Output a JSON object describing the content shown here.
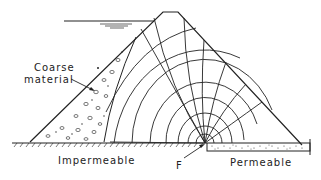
{
  "labels": {
    "coarse_line1": "Coarse",
    "coarse_line2": "material",
    "impermeable": "Impermeable",
    "permeable": "Permeable",
    "focus": "F"
  },
  "colors": {
    "ink": "#222222",
    "background": "#ffffff"
  }
}
